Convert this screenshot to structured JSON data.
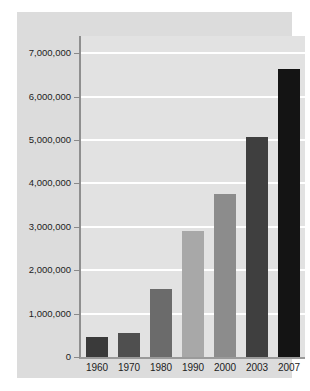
{
  "chart_data": {
    "type": "bar",
    "title": "",
    "subtitle": "",
    "xlabel": "",
    "ylabel": "",
    "categories": [
      "1960",
      "1970",
      "1980",
      "1990",
      "2000",
      "2003",
      "2007"
    ],
    "values": [
      450000,
      550000,
      1570000,
      2900000,
      3750000,
      5070000,
      6650000
    ],
    "series": [
      {
        "name": "",
        "values": [
          450000,
          550000,
          1570000,
          2900000,
          3750000,
          5070000,
          6650000
        ]
      }
    ],
    "bar_colors": [
      "#3a3a3a",
      "#4f4f4f",
      "#6b6b6b",
      "#a8a8a8",
      "#8c8c8c",
      "#3f3f3f",
      "#141414"
    ],
    "ylim": [
      0,
      7400000
    ],
    "yticks": [
      0,
      1000000,
      2000000,
      3000000,
      4000000,
      5000000,
      6000000,
      7000000
    ],
    "ytick_labels": [
      "0",
      "1,000,000",
      "2,000,000",
      "3,000,000",
      "4,000,000",
      "5,000,000",
      "6,000,000",
      "7,000,000"
    ],
    "grid": true,
    "gridline_color": "#ffffff",
    "legend": null,
    "legend_position": "none",
    "plot_background": "#e2e2e2",
    "panel_background": "#dcdcdc",
    "page_background": "#ffffff",
    "axis_color": "#8f8f8f",
    "text_color": "#1c1c1c"
  }
}
